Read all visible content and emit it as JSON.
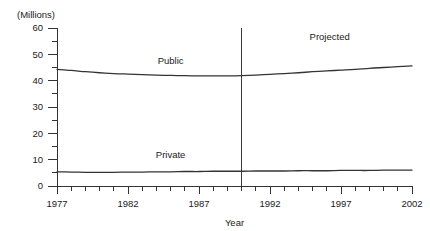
{
  "chart_data": {
    "type": "line",
    "title": "",
    "subtitle": "",
    "xlabel": "Year",
    "ylabel": "",
    "unit_label": "(Millions)",
    "xlim": [
      1977,
      2002
    ],
    "ylim": [
      0,
      60
    ],
    "grid": false,
    "legend_position": "inline-series-labels",
    "x_tick_labels": [
      "1977",
      "1982",
      "1987",
      "1992",
      "1997",
      "2002"
    ],
    "x_tick_values": [
      1977,
      1982,
      1987,
      1992,
      1997,
      2002
    ],
    "x_minor_step": 1,
    "y_tick_labels": [
      "0",
      "10",
      "20",
      "30",
      "40",
      "50",
      "60"
    ],
    "y_tick_values": [
      0,
      10,
      20,
      30,
      40,
      50,
      60
    ],
    "y_minor_step": 5,
    "x": [
      1977,
      1978,
      1979,
      1980,
      1981,
      1982,
      1983,
      1984,
      1985,
      1986,
      1987,
      1988,
      1989,
      1990,
      1991,
      1992,
      1993,
      1994,
      1995,
      1996,
      1997,
      1998,
      1999,
      2000,
      2001,
      2002
    ],
    "series": [
      {
        "name": "Public",
        "label": "Public",
        "color": "#333333",
        "values": [
          44.3,
          43.9,
          43.4,
          43.0,
          42.7,
          42.5,
          42.3,
          42.1,
          42.0,
          41.9,
          41.8,
          41.8,
          41.8,
          41.9,
          42.1,
          42.4,
          42.7,
          43.0,
          43.4,
          43.7,
          44.0,
          44.3,
          44.7,
          45.0,
          45.3,
          45.6
        ]
      },
      {
        "name": "Private",
        "label": "Private",
        "color": "#333333",
        "values": [
          5.4,
          5.3,
          5.2,
          5.2,
          5.2,
          5.3,
          5.3,
          5.4,
          5.4,
          5.5,
          5.5,
          5.6,
          5.6,
          5.6,
          5.7,
          5.7,
          5.7,
          5.8,
          5.8,
          5.8,
          5.9,
          5.9,
          5.9,
          6.0,
          6.0,
          6.0
        ]
      }
    ],
    "annotations": [
      {
        "name": "projected",
        "text": "Projected",
        "x": 1996.2,
        "y": 55.5
      }
    ],
    "divider": {
      "name": "projection-divider",
      "x": 1990,
      "y_top": 60,
      "y_bottom": 0
    },
    "series_label_positions": [
      {
        "series": "Public",
        "x": 1985.0,
        "y": 46.5
      },
      {
        "series": "Private",
        "x": 1985.0,
        "y": 10.5
      }
    ]
  }
}
